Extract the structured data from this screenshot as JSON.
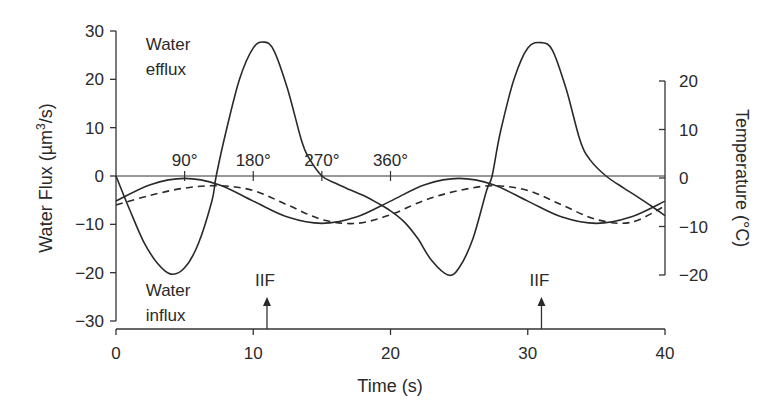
{
  "chart_data": {
    "type": "line",
    "title": "",
    "xlabel": "Time (s)",
    "ylabel": "Water Flux (µm³/s)",
    "ylabel_parts": {
      "main": "Water Flux (µm",
      "sup": "3",
      "tail": "/s)"
    },
    "y2label": "Temperature (°C)",
    "xlim": [
      0,
      40
    ],
    "ylim": [
      -30,
      30
    ],
    "y2lim": [
      -20,
      20
    ],
    "x_ticks": [
      0,
      10,
      20,
      30,
      40
    ],
    "x_tick_labels": [
      "0",
      "10",
      "20",
      "30",
      "40"
    ],
    "y_ticks": [
      30,
      20,
      10,
      0,
      -10,
      -20,
      -30
    ],
    "y_tick_labels": [
      "30",
      "20",
      "10",
      "0",
      "−10",
      "−20",
      "−30"
    ],
    "y2_ticks": [
      20,
      10,
      0,
      -10,
      -20
    ],
    "y2_tick_labels": [
      "20",
      "10",
      "0",
      "−10",
      "−20"
    ],
    "grid": false,
    "phase_ticks": [
      {
        "t": 5,
        "label": "90°"
      },
      {
        "t": 10,
        "label": "180°"
      },
      {
        "t": 15,
        "label": "270°"
      },
      {
        "t": 20,
        "label": "360°"
      }
    ],
    "annotations": [
      {
        "text_lines": [
          "Water",
          "efflux"
        ],
        "t": 1,
        "v": 29
      },
      {
        "text_lines": [
          "Water",
          "influx"
        ],
        "t": 1,
        "v": -22
      },
      {
        "text": "IIF",
        "t": 11,
        "arrow": true
      },
      {
        "text": "IIF",
        "t": 31,
        "arrow": true
      }
    ],
    "series": [
      {
        "name": "Water flux",
        "axis": "left",
        "style": "solid",
        "x": [
          0,
          1,
          2,
          3,
          4,
          5,
          6,
          7,
          7.3,
          8,
          9,
          10,
          10.8,
          11.5,
          12.5,
          13.5,
          14,
          15,
          16,
          17,
          18,
          19,
          20,
          21,
          22,
          23,
          24.2,
          25,
          26,
          27,
          27.4,
          28,
          29,
          30,
          31,
          31.8,
          32.8,
          33.8,
          34.5,
          35.7,
          37,
          38,
          39,
          40
        ],
        "values": [
          0,
          -7,
          -13.5,
          -18,
          -20.3,
          -19,
          -14,
          -5,
          0,
          9,
          20,
          26.5,
          27.7,
          26,
          18,
          7.5,
          4,
          0,
          -1.5,
          -2.8,
          -4,
          -5.5,
          -7.2,
          -9.5,
          -13,
          -17.5,
          -20.5,
          -19,
          -13,
          -3,
          0,
          9,
          20,
          26.5,
          27.6,
          26,
          18,
          7.5,
          3.5,
          0,
          -2.5,
          -4.3,
          -6.2,
          -8.2
        ]
      },
      {
        "name": "Temperature (solid)",
        "axis": "left",
        "style": "solid",
        "x": [
          0,
          2.5,
          5,
          7.5,
          10,
          12.5,
          15,
          17.5,
          20,
          22.5,
          25,
          27.5,
          30,
          32.5,
          35,
          37.5,
          40
        ],
        "values": [
          -5.2,
          -1.8,
          -0.5,
          -1.8,
          -5.2,
          -8.5,
          -9.8,
          -8.5,
          -5.2,
          -1.8,
          -0.5,
          -1.8,
          -5.2,
          -8.5,
          -9.8,
          -8.5,
          -5.2
        ]
      },
      {
        "name": "Temperature (dashed)",
        "axis": "left",
        "style": "dashed",
        "x": [
          0,
          2.5,
          5,
          7.5,
          10,
          12.5,
          15,
          17.5,
          20,
          22.5,
          25,
          27.5,
          30,
          32.5,
          35,
          37.5,
          40
        ],
        "values": [
          -6,
          -4,
          -2.5,
          -2,
          -3,
          -6,
          -9,
          -9.8,
          -8,
          -5,
          -3,
          -2,
          -3,
          -6,
          -9,
          -9.6,
          -6.2
        ]
      }
    ]
  }
}
